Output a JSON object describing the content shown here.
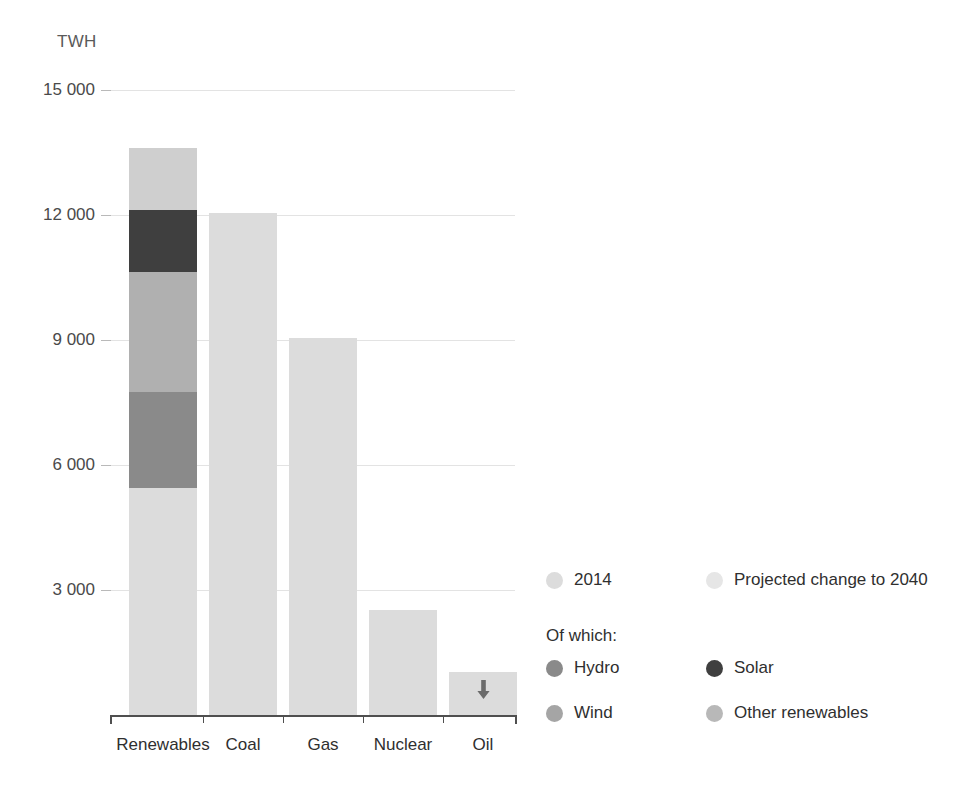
{
  "axis": {
    "unit_label": "TWH",
    "y_ticks": [
      "15 000",
      "12 000",
      "9 000",
      "6 000",
      "3 000"
    ],
    "y_tick_values": [
      15000,
      12000,
      9000,
      6000,
      3000
    ]
  },
  "legend": {
    "subtitle": "Of which:",
    "top_row": [
      {
        "label": "2014",
        "color": "#dcdcdc"
      },
      {
        "label": "Projected change to 2040",
        "color": "#e6e6e6"
      }
    ],
    "sub_rows": [
      {
        "label": "Hydro",
        "color": "#8a8a8a"
      },
      {
        "label": "Solar",
        "color": "#3f3f3f"
      },
      {
        "label": "Wind",
        "color": "#a5a5a5"
      },
      {
        "label": "Other renewables",
        "color": "#b8b8b8"
      }
    ]
  },
  "chart_data": {
    "type": "bar",
    "title": "",
    "xlabel": "",
    "ylabel": "TWH",
    "ylim": [
      0,
      15000
    ],
    "grid": true,
    "legend_position": "right",
    "categories": [
      "Renewables",
      "Coal",
      "Gas",
      "Nuclear",
      "Oil"
    ],
    "values": [
      13600,
      11950,
      9000,
      2520,
      1030
    ],
    "series": [
      {
        "name": "2014",
        "color": "#dcdcdc",
        "values": [
          5470,
          9100,
          5150,
          2520,
          1030
        ]
      },
      {
        "name": "Projected change to 2040",
        "color": "#dcdcdc",
        "values": [
          8130,
          2850,
          3850,
          0,
          -120
        ]
      }
    ],
    "renewables_breakdown": [
      {
        "name": "2014",
        "color": "#dcdcdc",
        "from": 0,
        "to": 5470
      },
      {
        "name": "Hydro",
        "color": "#8a8a8a",
        "from": 5470,
        "to": 7750
      },
      {
        "name": "Other renewables",
        "color": "#b8b8b8",
        "from": 7750,
        "to": 10630
      },
      {
        "name": "Solar",
        "color": "#3f3f3f",
        "from": 10630,
        "to": 12120
      },
      {
        "name": "Wind",
        "color": "#cfcfcf",
        "from": 12120,
        "to": 13600
      }
    ],
    "annotations": [
      {
        "category": "Oil",
        "symbol": "down-arrow",
        "meaning": "projected decline to 2040"
      }
    ]
  },
  "bars": [
    {
      "name": "Renewables",
      "center_x": 163,
      "width": 68,
      "segments": [
        {
          "name": "base-2014",
          "color": "#dcdcdc",
          "top_px": 488,
          "bottom_px": 715
        },
        {
          "name": "hydro",
          "color": "#8a8a8a",
          "top_px": 392,
          "bottom_px": 488
        },
        {
          "name": "other-renewables",
          "color": "#b0b0b0",
          "top_px": 272,
          "bottom_px": 392
        },
        {
          "name": "solar",
          "color": "#3f3f3f",
          "top_px": 210,
          "bottom_px": 272
        },
        {
          "name": "wind",
          "color": "#cfcfcf",
          "top_px": 148,
          "bottom_px": 210
        }
      ]
    },
    {
      "name": "Coal",
      "center_x": 243,
      "width": 68,
      "segments": [
        {
          "name": "total",
          "color": "#dcdcdc",
          "top_px": 213,
          "bottom_px": 715
        }
      ]
    },
    {
      "name": "Gas",
      "center_x": 323,
      "width": 68,
      "segments": [
        {
          "name": "total",
          "color": "#dcdcdc",
          "top_px": 338,
          "bottom_px": 715
        }
      ]
    },
    {
      "name": "Nuclear",
      "center_x": 403,
      "width": 68,
      "segments": [
        {
          "name": "total",
          "color": "#dcdcdc",
          "top_px": 610,
          "bottom_px": 715
        }
      ]
    },
    {
      "name": "Oil",
      "center_x": 483,
      "width": 68,
      "segments": [
        {
          "name": "total",
          "color": "#dcdcdc",
          "top_px": 672,
          "bottom_px": 715
        }
      ]
    }
  ]
}
